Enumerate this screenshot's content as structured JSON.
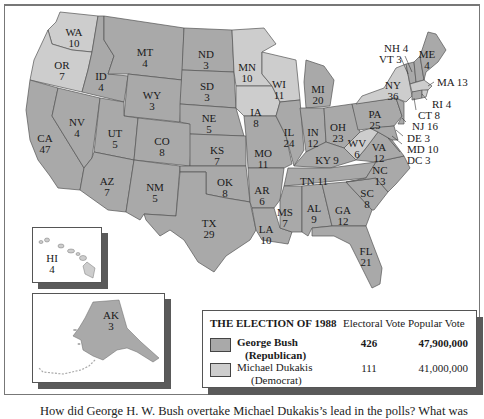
{
  "colors": {
    "republican": "#a9a9a9",
    "democrat": "#cdcdcd",
    "border": "#555555",
    "water": "#ffffff",
    "shadow": "#5a5a5a"
  },
  "states": [
    {
      "abbr": "WA",
      "votes": "10",
      "winner": "democrat"
    },
    {
      "abbr": "OR",
      "votes": "7",
      "winner": "democrat"
    },
    {
      "abbr": "CA",
      "votes": "47",
      "winner": "republican"
    },
    {
      "abbr": "ID",
      "votes": "4",
      "winner": "republican"
    },
    {
      "abbr": "NV",
      "votes": "4",
      "winner": "republican"
    },
    {
      "abbr": "MT",
      "votes": "4",
      "winner": "republican"
    },
    {
      "abbr": "WY",
      "votes": "3",
      "winner": "republican"
    },
    {
      "abbr": "UT",
      "votes": "5",
      "winner": "republican"
    },
    {
      "abbr": "AZ",
      "votes": "7",
      "winner": "republican"
    },
    {
      "abbr": "CO",
      "votes": "8",
      "winner": "republican"
    },
    {
      "abbr": "NM",
      "votes": "5",
      "winner": "republican"
    },
    {
      "abbr": "ND",
      "votes": "3",
      "winner": "republican"
    },
    {
      "abbr": "SD",
      "votes": "3",
      "winner": "republican"
    },
    {
      "abbr": "NE",
      "votes": "5",
      "winner": "republican"
    },
    {
      "abbr": "KS",
      "votes": "7",
      "winner": "republican"
    },
    {
      "abbr": "OK",
      "votes": "8",
      "winner": "republican"
    },
    {
      "abbr": "TX",
      "votes": "29",
      "winner": "republican"
    },
    {
      "abbr": "MN",
      "votes": "10",
      "winner": "democrat"
    },
    {
      "abbr": "IA",
      "votes": "8",
      "winner": "democrat"
    },
    {
      "abbr": "MO",
      "votes": "11",
      "winner": "republican"
    },
    {
      "abbr": "AR",
      "votes": "6",
      "winner": "republican"
    },
    {
      "abbr": "LA",
      "votes": "10",
      "winner": "republican"
    },
    {
      "abbr": "WI",
      "votes": "11",
      "winner": "democrat"
    },
    {
      "abbr": "IL",
      "votes": "24",
      "winner": "republican"
    },
    {
      "abbr": "MI",
      "votes": "20",
      "winner": "republican"
    },
    {
      "abbr": "IN",
      "votes": "12",
      "winner": "republican"
    },
    {
      "abbr": "OH",
      "votes": "23",
      "winner": "republican"
    },
    {
      "abbr": "KY",
      "votes": "9",
      "winner": "republican"
    },
    {
      "abbr": "TN",
      "votes": "11",
      "winner": "republican"
    },
    {
      "abbr": "MS",
      "votes": "7",
      "winner": "republican"
    },
    {
      "abbr": "AL",
      "votes": "9",
      "winner": "republican"
    },
    {
      "abbr": "GA",
      "votes": "12",
      "winner": "republican"
    },
    {
      "abbr": "FL",
      "votes": "21",
      "winner": "republican"
    },
    {
      "abbr": "SC",
      "votes": "8",
      "winner": "republican"
    },
    {
      "abbr": "NC",
      "votes": "13",
      "winner": "republican"
    },
    {
      "abbr": "VA",
      "votes": "12",
      "winner": "republican"
    },
    {
      "abbr": "WV",
      "votes": "6",
      "winner": "democrat"
    },
    {
      "abbr": "PA",
      "votes": "25",
      "winner": "republican"
    },
    {
      "abbr": "NY",
      "votes": "36",
      "winner": "democrat"
    },
    {
      "abbr": "VT",
      "votes": "3",
      "winner": "republican"
    },
    {
      "abbr": "NH",
      "votes": "4",
      "winner": "republican"
    },
    {
      "abbr": "ME",
      "votes": "4",
      "winner": "republican"
    },
    {
      "abbr": "MA",
      "votes": "13",
      "winner": "democrat"
    },
    {
      "abbr": "RI",
      "votes": "4",
      "winner": "democrat"
    },
    {
      "abbr": "CT",
      "votes": "8",
      "winner": "republican"
    },
    {
      "abbr": "NJ",
      "votes": "16",
      "winner": "republican"
    },
    {
      "abbr": "DE",
      "votes": "3",
      "winner": "republican"
    },
    {
      "abbr": "MD",
      "votes": "10",
      "winner": "republican"
    },
    {
      "abbr": "DC",
      "votes": "3",
      "winner": "democrat"
    },
    {
      "abbr": "HI",
      "votes": "4",
      "winner": "democrat"
    },
    {
      "abbr": "AK",
      "votes": "3",
      "winner": "republican"
    }
  ],
  "labels": {
    "WA": "WA",
    "WA_v": "10",
    "OR": "OR",
    "OR_v": "7",
    "CA": "CA",
    "CA_v": "47",
    "ID": "ID",
    "ID_v": "4",
    "NV": "NV",
    "NV_v": "4",
    "MT": "MT",
    "MT_v": "4",
    "WY": "WY",
    "WY_v": "3",
    "UT": "UT",
    "UT_v": "5",
    "AZ": "AZ",
    "AZ_v": "7",
    "CO": "CO",
    "CO_v": "8",
    "NM": "NM",
    "NM_v": "5",
    "ND": "ND",
    "ND_v": "3",
    "SD": "SD",
    "SD_v": "3",
    "NE": "NE",
    "NE_v": "5",
    "KS": "KS",
    "KS_v": "7",
    "OK": "OK",
    "OK_v": "8",
    "TX": "TX",
    "TX_v": "29",
    "MN": "MN",
    "MN_v": "10",
    "IA": "IA",
    "IA_v": "8",
    "MO": "MO",
    "MO_v": "11",
    "AR": "AR",
    "AR_v": "6",
    "LA": "LA",
    "LA_v": "10",
    "WI": "WI",
    "WI_v": "11",
    "IL": "IL",
    "IL_v": "24",
    "MI": "MI",
    "MI_v": "20",
    "IN": "IN",
    "IN_v": "12",
    "OH": "OH",
    "OH_v": "23",
    "KY": "KY 9",
    "TN": "TN 11",
    "MS": "MS",
    "MS_v": "7",
    "AL": "AL",
    "AL_v": "9",
    "GA": "GA",
    "GA_v": "12",
    "FL": "FL",
    "FL_v": "21",
    "SC": "SC",
    "SC_v": "8",
    "NC": "NC",
    "NC_v": "13",
    "VA": "VA",
    "VA_v": "12",
    "WV": "WV",
    "WV_v": "6",
    "PA": "PA",
    "PA_v": "25",
    "NY": "NY",
    "NY_v": "36",
    "ME": "ME",
    "ME_v": "4",
    "NH": "NH 4",
    "VT": "VT 3",
    "MA": "MA 13",
    "RI": "RI 4",
    "CT": "CT 8",
    "NJ": "NJ 16",
    "DE": "DE 3",
    "MD": "MD 10",
    "DC": "DC 3",
    "HI": "HI",
    "HI_v": "4",
    "AK": "AK",
    "AK_v": "3"
  },
  "legend": {
    "title": "THE ELECTION OF 1988",
    "col_electoral": "Electoral Vote",
    "col_popular": "Popular Vote",
    "rows": [
      {
        "name": "George Bush",
        "party": "(Republican)",
        "electoral": "426",
        "popular": "47,900,000"
      },
      {
        "name": "Michael Dukakis",
        "party": "(Democrat)",
        "electoral": "111",
        "popular": "41,000,000"
      }
    ]
  },
  "caption": "How did George H. W. Bush overtake Michael Dukakis’s lead in the polls? What was"
}
